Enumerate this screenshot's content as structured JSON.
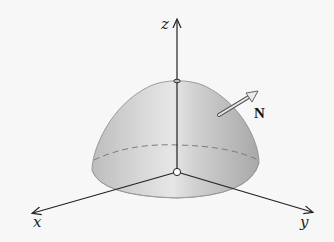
{
  "diagram": {
    "axes": {
      "x_label": "x",
      "y_label": "y",
      "z_label": "z"
    },
    "normal_vector": {
      "label": "N"
    },
    "colors": {
      "background": "#f7f7f7",
      "surface_light": "#e2e2e2",
      "surface_mid": "#c8c8c8",
      "surface_dark": "#a9a9a9",
      "axis": "#222222",
      "dashed_trace": "#7a7a7a",
      "arrow_fill": "#e8e8e8"
    }
  }
}
